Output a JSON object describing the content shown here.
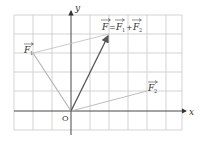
{
  "diagram": {
    "type": "vector-addition-grid",
    "grid": {
      "cols": 9,
      "rows": 6,
      "unit_px": 19,
      "origin_px": [
        71,
        111
      ],
      "line_color": "#c8c8c8"
    },
    "axes": {
      "x_label": "x",
      "y_label": "y",
      "origin_label": "O",
      "color": "#333333"
    },
    "vectors": [
      {
        "id": "F1",
        "label": "F",
        "subscript": "1",
        "tail": [
          0,
          0
        ],
        "head": [
          -2,
          3
        ],
        "color": "#b5b5b5"
      },
      {
        "id": "F2",
        "label": "F",
        "subscript": "2",
        "tail": [
          0,
          0
        ],
        "head": [
          4,
          1
        ],
        "color": "#b5b5b5"
      },
      {
        "id": "F",
        "label": "F",
        "tail": [
          0,
          0
        ],
        "head": [
          2,
          4
        ],
        "color": "#555555"
      }
    ],
    "equation": {
      "lhs": "F",
      "eq": "=",
      "t1": "F",
      "t1_sub": "1",
      "plus": "+",
      "t2": "F",
      "t2_sub": "2"
    },
    "parallelogram_edges_color": "#bdbdbd"
  }
}
